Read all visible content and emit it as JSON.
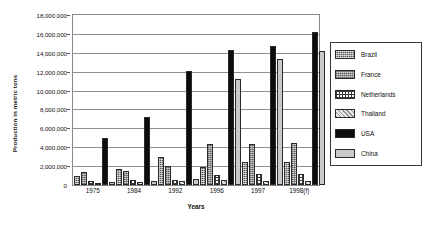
{
  "chart_data": {
    "type": "bar",
    "title": "",
    "xlabel": "Years",
    "ylabel": "Production in metric tons",
    "categories": [
      "1975",
      "1984",
      "1992",
      "1996",
      "1997",
      "1998(f)"
    ],
    "ylim": [
      0,
      18000000
    ],
    "ytick_values": [
      0,
      2000000,
      4000000,
      6000000,
      8000000,
      10000000,
      12000000,
      14000000,
      16000000,
      18000000
    ],
    "ytick_labels": [
      "0",
      "2,000,000",
      "4,000,000",
      "6,000,000",
      "8,000,000",
      "10,000,000",
      "12,000,000",
      "14,000,000",
      "16,000,000",
      "18,000,000"
    ],
    "grid": true,
    "legend_position": "right",
    "series": [
      {
        "name": "Brazil",
        "pattern": "dark-crosshatch",
        "color": "#555555",
        "values": [
          1000000,
          1700000,
          3000000,
          1900000,
          2400000,
          2400000
        ]
      },
      {
        "name": "France",
        "pattern": "light-crosshatch",
        "color": "#d9d9d9",
        "values": [
          1400000,
          1500000,
          2000000,
          4300000,
          4300000,
          4500000
        ]
      },
      {
        "name": "Netherlands",
        "pattern": "grid-dots",
        "color": "#ffffff",
        "values": [
          400000,
          500000,
          500000,
          1100000,
          1200000,
          1200000
        ]
      },
      {
        "name": "Thailand",
        "pattern": "light-speckle",
        "color": "#e8e8e8",
        "values": [
          200000,
          300000,
          400000,
          500000,
          400000,
          400000
        ]
      },
      {
        "name": "USA",
        "pattern": "solid-black",
        "color": "#0d0d0d",
        "values": [
          5000000,
          7200000,
          12100000,
          14300000,
          14700000,
          16200000
        ]
      },
      {
        "name": "China",
        "pattern": "solid-light-gray",
        "color": "#c9c9c9",
        "values": [
          300000,
          400000,
          600000,
          11200000,
          13300000,
          14200000
        ]
      }
    ]
  },
  "legend": {
    "items": [
      "Brazil",
      "France",
      "Netherlands",
      "Thailand",
      "USA",
      "China"
    ]
  }
}
